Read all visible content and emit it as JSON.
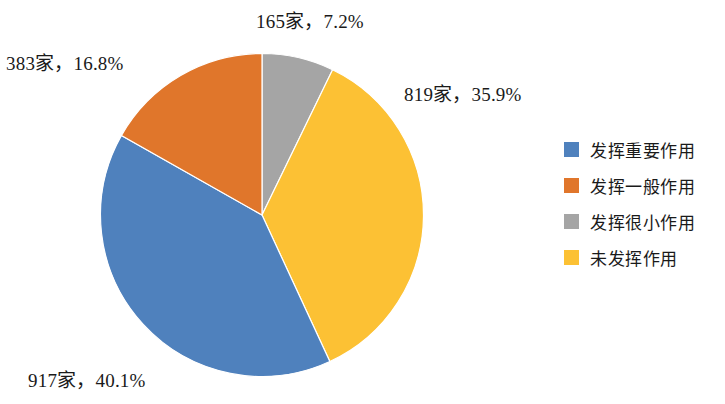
{
  "chart_data": {
    "type": "pie",
    "title": "",
    "subtitle": "",
    "xlabel": "",
    "ylabel": "",
    "grid": false,
    "legend_position": "right",
    "start_angle_deg": 0,
    "direction": "clockwise",
    "categories": [
      "发挥重要作用",
      "发挥一般作用",
      "发挥很小作用",
      "未发挥作用"
    ],
    "values": [
      917,
      383,
      165,
      819
    ],
    "percentages": [
      40.1,
      16.8,
      7.2,
      35.9
    ],
    "unit": "家",
    "colors": [
      "#4f81bd",
      "#e0762b",
      "#a5a5a5",
      "#fcc134"
    ],
    "slices": [
      {
        "label": "发挥重要作用",
        "value": 917,
        "percent": 40.1,
        "color": "#4f81bd",
        "data_label": "917家，40.1%"
      },
      {
        "label": "发挥一般作用",
        "value": 383,
        "percent": 16.8,
        "color": "#e0762b",
        "data_label": "383家，16.8%"
      },
      {
        "label": "发挥很小作用",
        "value": 165,
        "percent": 7.2,
        "color": "#a5a5a5",
        "data_label": "165家，7.2%"
      },
      {
        "label": "未发挥作用",
        "value": 819,
        "percent": 35.9,
        "color": "#fcc134",
        "data_label": "819家，35.9%"
      }
    ]
  },
  "labels": {
    "gray": "165家，7.2%",
    "yellow": "819家，35.9%",
    "orange": "383家，16.8%",
    "blue": "917家，40.1%"
  },
  "legend": {
    "items": [
      {
        "label": "发挥重要作用",
        "color": "#4f81bd"
      },
      {
        "label": "发挥一般作用",
        "color": "#e0762b"
      },
      {
        "label": "发挥很小作用",
        "color": "#a5a5a5"
      },
      {
        "label": "未发挥作用",
        "color": "#fcc134"
      }
    ]
  }
}
